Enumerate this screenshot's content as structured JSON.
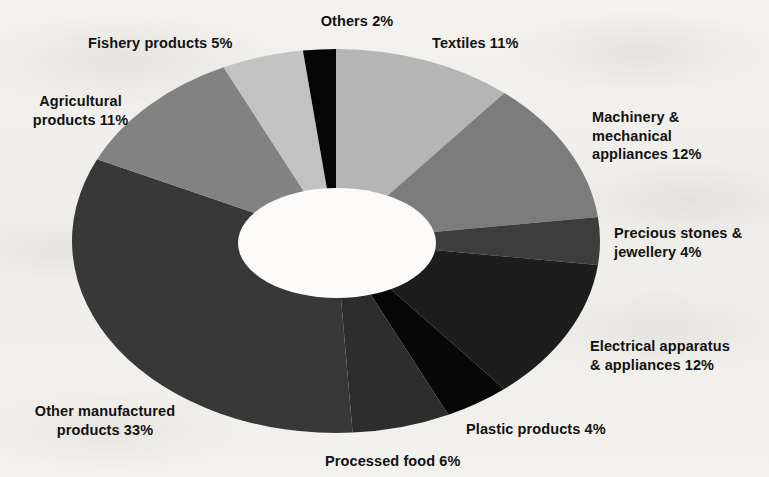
{
  "figure": {
    "background_color": "#f2f0ed",
    "hole_color": "#fbfaf8"
  },
  "chart_data": {
    "type": "pie",
    "variant": "donut",
    "title": "",
    "subtitle": "",
    "xlabel": "",
    "ylabel": "",
    "units": "%",
    "total": 100,
    "legend": "none",
    "grid": false,
    "labels_position": "outside",
    "start_angle_deg": 0,
    "direction": "clockwise",
    "categories": [
      "Textiles",
      "Machinery & mechanical appliances",
      "Precious stones & jewellery",
      "Electrical apparatus & appliances",
      "Plastic products",
      "Processed food",
      "Other manufactured products",
      "Agricultural products",
      "Fishery products",
      "Others"
    ],
    "values": [
      11,
      12,
      4,
      12,
      4,
      6,
      33,
      11,
      5,
      2
    ],
    "colors": [
      "#b5b5b5",
      "#7c7c7c",
      "#3d3d3d",
      "#1d1d1d",
      "#070707",
      "#2d2d2d",
      "#383838",
      "#828282",
      "#c2c2c2",
      "#060606"
    ],
    "slices": [
      {
        "label": "Textiles",
        "value": 11,
        "text": "Textiles 11%",
        "color": "#b5b5b5"
      },
      {
        "label": "Machinery & mechanical appliances",
        "value": 12,
        "text": "Machinery &\nmechanical\nappliances 12%",
        "color": "#7c7c7c"
      },
      {
        "label": "Precious stones & jewellery",
        "value": 4,
        "text": "Precious stones &\njewellery 4%",
        "color": "#3d3d3d"
      },
      {
        "label": "Electrical apparatus & appliances",
        "value": 12,
        "text": "Electrical apparatus\n& appliances 12%",
        "color": "#1d1d1d"
      },
      {
        "label": "Plastic products",
        "value": 4,
        "text": "Plastic products 4%",
        "color": "#070707"
      },
      {
        "label": "Processed food",
        "value": 6,
        "text": "Processed food 6%",
        "color": "#2d2d2d"
      },
      {
        "label": "Other manufactured products",
        "value": 33,
        "text": "Other manufactured\nproducts 33%",
        "color": "#383838"
      },
      {
        "label": "Agricultural products",
        "value": 11,
        "text": "Agricultural\nproducts 11%",
        "color": "#828282"
      },
      {
        "label": "Fishery products",
        "value": 5,
        "text": "Fishery products 5%",
        "color": "#c2c2c2"
      },
      {
        "label": "Others",
        "value": 2,
        "text": "Others 2%",
        "color": "#060606"
      }
    ]
  }
}
